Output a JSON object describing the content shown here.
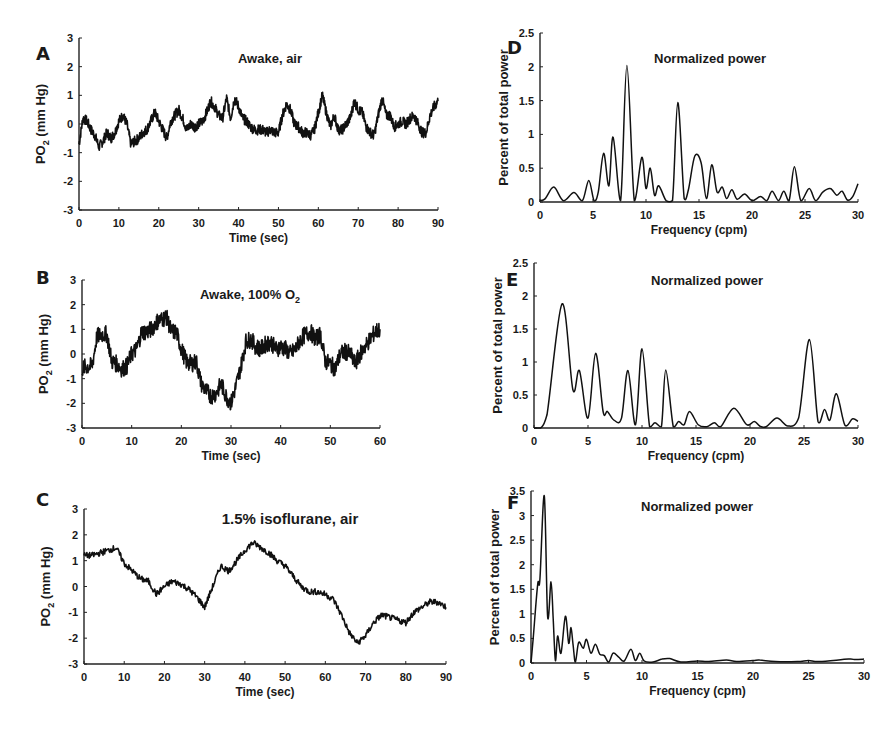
{
  "figure": {
    "panels_left_ylabel": "PO2 (mm Hg)",
    "panels_right_ylabel": "Percent of total power"
  },
  "chart_data": [
    {
      "id": "A",
      "type": "line",
      "title": "Awake, air",
      "xlabel": "Time (sec)",
      "ylabel": "PO2 (mm Hg)",
      "xlim": [
        0,
        90
      ],
      "ylim": [
        -3,
        3
      ],
      "xticks": [
        0,
        10,
        20,
        30,
        40,
        50,
        60,
        70,
        80,
        90
      ],
      "yticks": [
        -3,
        -2,
        -1,
        0,
        1,
        2,
        3
      ],
      "x": [
        0,
        1,
        2,
        3,
        4,
        5,
        6,
        7,
        8,
        9,
        10,
        11,
        12,
        13,
        14,
        15,
        16,
        17,
        18,
        19,
        20,
        21,
        22,
        23,
        24,
        25,
        26,
        27,
        28,
        29,
        30,
        31,
        32,
        33,
        34,
        35,
        36,
        37,
        38,
        39,
        40,
        41,
        42,
        43,
        44,
        45,
        46,
        47,
        48,
        49,
        50,
        51,
        52,
        53,
        54,
        55,
        56,
        57,
        58,
        59,
        60,
        61,
        62,
        63,
        64,
        65,
        66,
        67,
        68,
        69,
        70,
        71,
        72,
        73,
        74,
        75,
        76,
        77,
        78,
        79,
        80,
        81,
        82,
        83,
        84,
        85,
        86,
        87,
        88,
        89,
        90
      ],
      "values": [
        -0.7,
        0.2,
        0.1,
        -0.2,
        -0.4,
        -0.8,
        -0.6,
        -0.3,
        -0.5,
        -0.3,
        0.1,
        0.3,
        0.0,
        -0.7,
        -0.6,
        -0.5,
        -0.3,
        -0.2,
        0.1,
        0.4,
        0.1,
        -0.2,
        -0.5,
        0.1,
        0.3,
        0.5,
        0.2,
        -0.2,
        0.0,
        -0.1,
        0.0,
        0.1,
        0.4,
        0.8,
        0.6,
        0.3,
        0.2,
        0.9,
        0.2,
        0.9,
        0.6,
        0.2,
        0.1,
        -0.1,
        -0.2,
        -0.2,
        -0.2,
        -0.3,
        -0.2,
        -0.3,
        -0.3,
        0.3,
        0.7,
        0.5,
        0.0,
        -0.1,
        -0.3,
        -0.3,
        -0.4,
        -0.2,
        0.4,
        1.0,
        0.4,
        -0.1,
        0.3,
        -0.2,
        -0.2,
        0.0,
        0.2,
        0.8,
        0.5,
        0.4,
        -0.1,
        -0.3,
        -0.4,
        0.3,
        0.9,
        0.3,
        0.3,
        -0.1,
        0.0,
        0.1,
        0.0,
        0.2,
        0.3,
        0.0,
        -0.3,
        -0.3,
        0.3,
        0.6,
        0.8
      ],
      "noise": 0.18
    },
    {
      "id": "B",
      "type": "line",
      "title": "Awake, 100% O",
      "title_sub": "2",
      "xlabel": "Time (sec)",
      "ylabel": "PO2 (mm Hg)",
      "xlim": [
        0,
        60
      ],
      "ylim": [
        -3,
        3
      ],
      "xticks": [
        0,
        10,
        20,
        30,
        40,
        50,
        60
      ],
      "yticks": [
        -3,
        -2,
        -1,
        0,
        1,
        2,
        3
      ],
      "x": [
        0,
        1,
        2,
        3,
        4,
        5,
        6,
        7,
        8,
        9,
        10,
        11,
        12,
        13,
        14,
        15,
        16,
        17,
        18,
        19,
        20,
        21,
        22,
        23,
        24,
        25,
        26,
        27,
        28,
        29,
        30,
        31,
        32,
        33,
        34,
        35,
        36,
        37,
        38,
        39,
        40,
        41,
        42,
        43,
        44,
        45,
        46,
        47,
        48,
        49,
        50,
        51,
        52,
        53,
        54,
        55,
        56,
        57,
        58,
        59,
        60
      ],
      "values": [
        -0.6,
        -0.5,
        -0.5,
        0.7,
        0.8,
        0.8,
        -0.3,
        -0.4,
        -0.6,
        -0.5,
        0.0,
        0.2,
        0.9,
        0.9,
        1.0,
        1.3,
        1.4,
        1.5,
        0.9,
        0.9,
        0.2,
        -0.3,
        -0.4,
        -0.3,
        -1.2,
        -1.5,
        -1.7,
        -1.6,
        -1.2,
        -1.7,
        -2.0,
        -1.3,
        -0.5,
        0.5,
        0.6,
        0.3,
        0.2,
        0.4,
        0.5,
        0.2,
        0.3,
        0.2,
        0.0,
        0.2,
        0.6,
        0.8,
        0.9,
        0.6,
        0.8,
        -0.3,
        -0.4,
        -0.6,
        0.0,
        0.1,
        0.0,
        -0.4,
        0.0,
        0.3,
        0.6,
        0.9,
        1.0
      ],
      "noise": 0.35
    },
    {
      "id": "C",
      "type": "line",
      "title": "1.5% isoflurane, air",
      "xlabel": "Time (sec)",
      "ylabel": "PO2 (mm Hg)",
      "xlim": [
        0,
        90
      ],
      "ylim": [
        -3,
        3
      ],
      "xticks": [
        0,
        10,
        20,
        30,
        40,
        50,
        60,
        70,
        80,
        90
      ],
      "yticks": [
        -3,
        -2,
        -1,
        0,
        1,
        2,
        3
      ],
      "x": [
        0,
        2,
        4,
        6,
        8,
        10,
        12,
        14,
        16,
        18,
        20,
        22,
        24,
        26,
        28,
        30,
        32,
        34,
        36,
        38,
        40,
        42,
        44,
        46,
        48,
        50,
        52,
        54,
        56,
        58,
        60,
        62,
        64,
        66,
        68,
        70,
        72,
        74,
        76,
        78,
        80,
        82,
        84,
        86,
        88,
        90
      ],
      "values": [
        1.2,
        1.2,
        1.3,
        1.4,
        1.5,
        0.9,
        0.6,
        0.3,
        0.2,
        -0.3,
        0.0,
        0.2,
        0.1,
        -0.1,
        -0.4,
        -0.8,
        0.0,
        0.8,
        0.6,
        1.0,
        1.4,
        1.7,
        1.5,
        1.3,
        1.0,
        0.8,
        0.4,
        0.0,
        -0.2,
        -0.2,
        -0.3,
        -0.5,
        -1.1,
        -1.8,
        -2.2,
        -1.9,
        -1.4,
        -1.1,
        -1.2,
        -1.3,
        -1.4,
        -1.0,
        -0.8,
        -0.6,
        -0.6,
        -0.8
      ],
      "noise": 0.12
    },
    {
      "id": "D",
      "type": "line",
      "title": "Normalized power",
      "xlabel": "Frequency (cpm)",
      "ylabel": "Percent of total power",
      "xlim": [
        0,
        30
      ],
      "ylim": [
        0,
        2.5
      ],
      "xticks": [
        0,
        5,
        10,
        15,
        20,
        25,
        30
      ],
      "yticks": [
        0,
        0.5,
        1,
        1.5,
        2,
        2.5
      ],
      "x": [
        0,
        0.5,
        1.3,
        2.2,
        3.2,
        4.0,
        4.6,
        5.1,
        5.5,
        6.0,
        6.5,
        6.9,
        7.6,
        8.2,
        8.9,
        9.6,
        10.0,
        10.4,
        10.8,
        11.2,
        11.9,
        12.5,
        13.0,
        13.6,
        14.0,
        14.6,
        15.2,
        15.7,
        16.2,
        16.7,
        17.2,
        17.6,
        18.1,
        18.6,
        19.3,
        20.0,
        20.8,
        21.4,
        21.9,
        22.5,
        23.0,
        23.5,
        24.0,
        24.6,
        25.4,
        26.0,
        26.7,
        27.4,
        28.0,
        28.5,
        29.0,
        29.5,
        30.0
      ],
      "values": [
        0.02,
        0.05,
        0.22,
        0.02,
        0.14,
        0.02,
        0.32,
        0.02,
        0.15,
        0.72,
        0.24,
        0.96,
        0.02,
        2.02,
        0.02,
        0.66,
        0.2,
        0.5,
        0.1,
        0.24,
        0.02,
        0.02,
        1.47,
        0.05,
        0.18,
        0.68,
        0.58,
        0.05,
        0.55,
        0.15,
        0.22,
        0.05,
        0.18,
        0.04,
        0.12,
        0.02,
        0.08,
        0.02,
        0.16,
        0.02,
        0.16,
        0.02,
        0.52,
        0.02,
        0.2,
        0.02,
        0.15,
        0.2,
        0.1,
        0.16,
        0.03,
        0.08,
        0.27
      ]
    },
    {
      "id": "E",
      "type": "line",
      "title": "Normalized power",
      "xlabel": "Frequency (cpm)",
      "ylabel": "Percent of total power",
      "xlim": [
        0,
        30
      ],
      "ylim": [
        0,
        2.5
      ],
      "xticks": [
        0,
        5,
        10,
        15,
        20,
        25,
        30
      ],
      "yticks": [
        0,
        0.5,
        1,
        1.5,
        2,
        2.5
      ],
      "x": [
        0,
        0.6,
        1.2,
        2.6,
        3.6,
        4.2,
        5.0,
        5.7,
        6.4,
        6.8,
        7.4,
        8.1,
        8.7,
        9.4,
        10.0,
        10.7,
        11.2,
        11.8,
        12.2,
        12.9,
        13.4,
        13.9,
        14.4,
        15.2,
        16.0,
        16.7,
        17.3,
        18.5,
        19.7,
        20.4,
        20.9,
        21.5,
        22.5,
        23.5,
        24.5,
        25.5,
        26.3,
        26.9,
        27.4,
        28.0,
        28.8,
        29.5,
        30.0
      ],
      "values": [
        0,
        0,
        0.2,
        1.88,
        0.58,
        0.87,
        0.15,
        1.13,
        0.25,
        0.25,
        0.12,
        0.15,
        0.87,
        0.05,
        1.2,
        0.02,
        0.08,
        0.02,
        0.88,
        0.02,
        0.1,
        0.05,
        0.25,
        0.05,
        0.02,
        0.08,
        0.02,
        0.3,
        0.05,
        0.1,
        0.03,
        0.02,
        0.15,
        0.03,
        0.15,
        1.34,
        0.1,
        0.28,
        0.12,
        0.52,
        0.04,
        0.14,
        0.1
      ]
    },
    {
      "id": "F",
      "type": "line",
      "title": "Normalized power",
      "xlabel": "Frequency (cpm)",
      "ylabel": "Percent of total power",
      "xlim": [
        0,
        30
      ],
      "ylim": [
        0,
        3.5
      ],
      "xticks": [
        0,
        5,
        10,
        15,
        20,
        25,
        30
      ],
      "yticks": [
        0,
        0.5,
        1,
        1.5,
        2,
        2.5,
        3,
        3.5
      ],
      "x": [
        0,
        0.2,
        0.6,
        0.8,
        1.2,
        1.5,
        1.8,
        2.0,
        2.2,
        2.4,
        2.7,
        3.1,
        3.4,
        3.6,
        3.8,
        4.0,
        4.3,
        4.7,
        5.0,
        5.4,
        5.8,
        6.2,
        6.6,
        7.0,
        7.4,
        7.9,
        8.4,
        9.0,
        9.4,
        9.8,
        10.2,
        11.0,
        11.8,
        12.5,
        13.5,
        15,
        16,
        17.6,
        18.5,
        20,
        20.6,
        22,
        24,
        25,
        26,
        28.6,
        29.2,
        30
      ],
      "values": [
        0,
        0.5,
        1.6,
        1.7,
        3.4,
        0.95,
        1.65,
        0.9,
        0.05,
        0.55,
        0.2,
        0.95,
        0.4,
        0.72,
        0.35,
        0.02,
        0.42,
        0.3,
        0.48,
        0.2,
        0.38,
        0.18,
        0.15,
        0.02,
        0.2,
        0.12,
        0.04,
        0.28,
        0.05,
        0.2,
        0.04,
        0.02,
        0.08,
        0.09,
        0.02,
        0.04,
        0.03,
        0.06,
        0.03,
        0.05,
        0.06,
        0.03,
        0.03,
        0.05,
        0.03,
        0.08,
        0.07,
        0.08
      ]
    }
  ],
  "layout_px": {
    "A": {
      "x0": 79,
      "x1": 438,
      "y_top": 38,
      "y_bot": 210,
      "lx": 36,
      "ly": 48,
      "title_x": 270,
      "title_y": 58
    },
    "B": {
      "x0": 82,
      "x1": 380,
      "y_top": 280,
      "y_bot": 428,
      "lx": 36,
      "ly": 272,
      "title_x": 250,
      "title_y": 294
    },
    "C": {
      "x0": 84,
      "x1": 446,
      "y_top": 509,
      "y_bot": 664,
      "lx": 36,
      "ly": 494,
      "title_x": 290,
      "title_y": 519
    },
    "D": {
      "x0": 540,
      "x1": 858,
      "y_top": 33,
      "y_bot": 202,
      "lx": 507,
      "ly": 42,
      "title_x": 710,
      "title_y": 58
    },
    "E": {
      "x0": 534,
      "x1": 858,
      "y_top": 263,
      "y_bot": 428,
      "lx": 506,
      "ly": 274,
      "title_x": 707,
      "title_y": 280
    },
    "F": {
      "x0": 531,
      "x1": 864,
      "y_top": 491,
      "y_bot": 663,
      "lx": 507,
      "ly": 497,
      "title_x": 697,
      "title_y": 506
    }
  }
}
